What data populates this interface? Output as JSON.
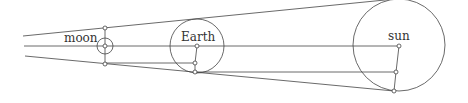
{
  "diagram": {
    "labels": {
      "moon": "moon",
      "earth": "Earth",
      "sun": "sun"
    },
    "colors": {
      "stroke": "#444444",
      "background": "#ffffff",
      "text": "#333333"
    }
  }
}
